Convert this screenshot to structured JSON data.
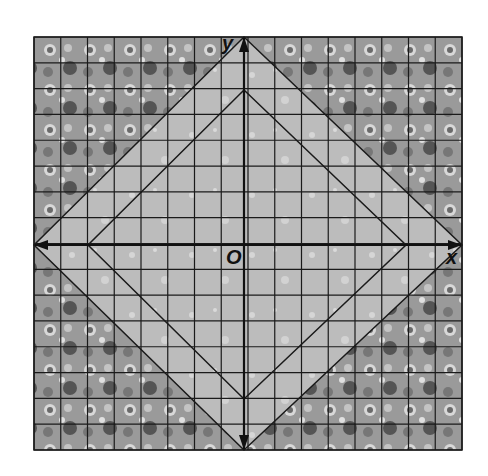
{
  "figure": {
    "type": "coordinate-grid-with-nested-squares",
    "grid": {
      "cells_x": 16,
      "cells_y": 16,
      "left": 34,
      "top": 37,
      "right": 462,
      "bottom": 450
    },
    "axes": {
      "x_label": "x",
      "y_label": "y",
      "origin_label": "O",
      "origin_px": [
        244,
        245
      ]
    },
    "outer_square_vertices": [
      [
        0,
        8
      ],
      [
        8,
        0
      ],
      [
        0,
        -8
      ],
      [
        -8,
        0
      ]
    ],
    "inner_square_vertices": [
      [
        0,
        6
      ],
      [
        6,
        0
      ],
      [
        0,
        -6
      ],
      [
        -6,
        0
      ]
    ],
    "colors": {
      "grid_line": "#1a1a1a",
      "diamond_fill": "#b9b9b9",
      "corner_pattern": "#8a8a8a",
      "axis": "#111111"
    }
  }
}
